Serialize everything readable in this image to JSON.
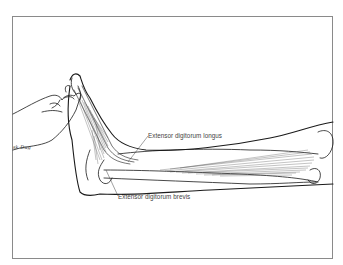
{
  "figure": {
    "labels": [
      {
        "id": "longus",
        "text": "Extensor digitorum longus"
      },
      {
        "id": "brevis",
        "text": "Extensor digitorum brevis"
      }
    ],
    "signature": "sk Dug",
    "colors": {
      "line": "#1a1a1a",
      "muscle_hatch": "#555555",
      "frame": "#8a8a8a",
      "label_text": "#444444"
    }
  }
}
